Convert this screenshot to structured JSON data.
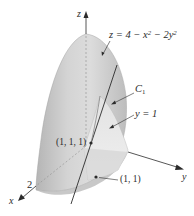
{
  "figure": {
    "axes": {
      "z_label": "z",
      "x_label": "x",
      "y_label": "y",
      "x_tick": "2"
    },
    "surface": {
      "equation_prefix": "z = 4 − x",
      "equation_mid": " − 2y",
      "exp": "2",
      "fill_color": "#c9c9c9",
      "shade_color": "#a9a9a9",
      "highlight_color": "#e6e6e6"
    },
    "curve_label": {
      "letter": "C",
      "subscript": "1"
    },
    "plane_label": "y = 1",
    "point_3d": "(1, 1, 1)",
    "point_2d": "(1, 1)",
    "colors": {
      "line": "#2b2b2b",
      "plane": "#ececec",
      "text": "#2b2b2b"
    }
  }
}
